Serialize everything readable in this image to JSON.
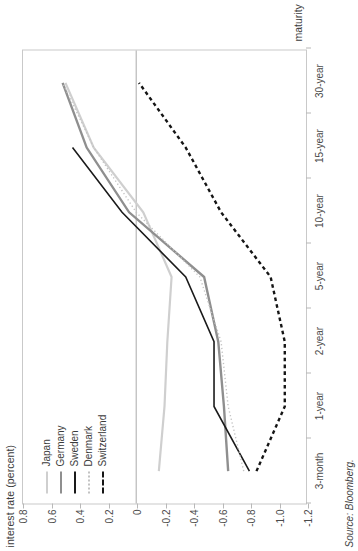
{
  "chart_data": {
    "type": "line",
    "title": "interest rate (percent)",
    "ylabel": "interest rate (percent)",
    "xlabel": "maturity",
    "source": "Source: Bloomberg.",
    "categories": [
      "3-month",
      "1-year",
      "2-year",
      "5-year",
      "10-year",
      "15-year",
      "30-year"
    ],
    "ylim": [
      -1.2,
      0.8
    ],
    "yticks": [
      0.8,
      0.6,
      0.4,
      0.2,
      0,
      -0.2,
      -0.4,
      -0.6,
      -0.8,
      -1.0,
      -1.2
    ],
    "ytick_labels": [
      "0.8",
      "0.6",
      "0.4",
      "0.2",
      "0",
      "-0.2",
      "-0.4",
      "-0.6",
      "-0.8",
      "-1.0",
      "-1.2"
    ],
    "grid": false,
    "zero_line": 0,
    "legend_position": "upper-left",
    "series": [
      {
        "name": "Japan",
        "color": "#cfcfcf",
        "style": "solid",
        "width": 2.2,
        "values": [
          -0.16,
          -0.2,
          -0.22,
          -0.25,
          -0.05,
          0.3,
          0.5
        ]
      },
      {
        "name": "Germany",
        "color": "#8f8f8f",
        "style": "solid",
        "width": 2.4,
        "values": [
          -0.65,
          -0.62,
          -0.58,
          -0.48,
          0.05,
          0.35,
          0.52
        ]
      },
      {
        "name": "Sweden",
        "color": "#1a1a1a",
        "style": "solid",
        "width": 1.6,
        "values": [
          -0.8,
          -0.55,
          -0.55,
          -0.35,
          0.1,
          0.45,
          null
        ]
      },
      {
        "name": "Denmark",
        "color": "#c2c2c2",
        "style": "dotted",
        "width": 1.4,
        "values": [
          -0.76,
          -0.65,
          -0.6,
          -0.45,
          0.0,
          0.3,
          0.52
        ]
      },
      {
        "name": "Switzerland",
        "color": "#151515",
        "style": "dashed",
        "width": 2.4,
        "values": [
          -0.85,
          -1.05,
          -1.05,
          -0.95,
          -0.6,
          -0.35,
          -0.02
        ]
      }
    ]
  },
  "legend": {
    "items": [
      {
        "label": "Japan"
      },
      {
        "label": "Germany"
      },
      {
        "label": "Sweden"
      },
      {
        "label": "Denmark"
      },
      {
        "label": "Switzerland"
      }
    ]
  }
}
